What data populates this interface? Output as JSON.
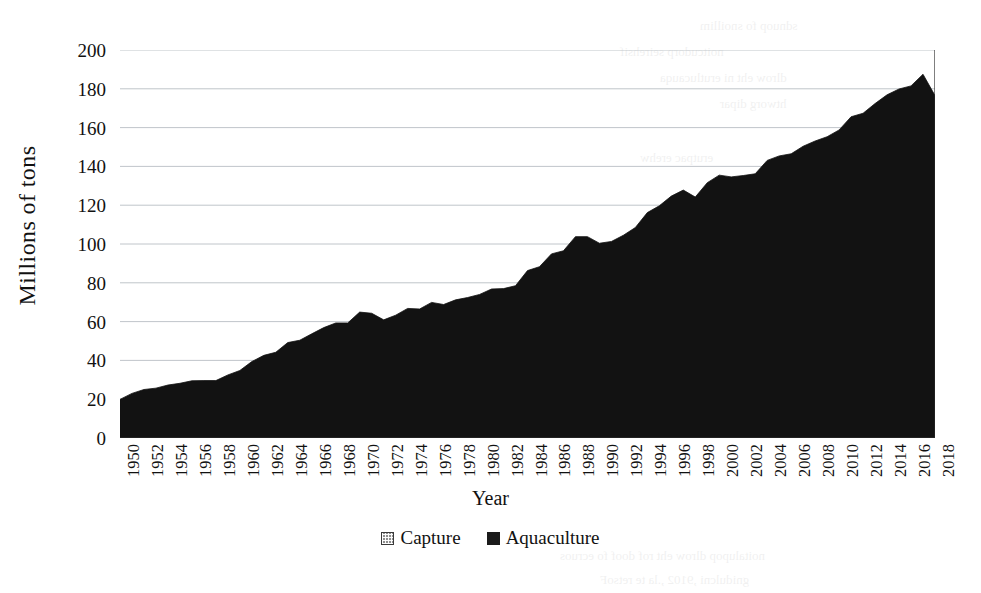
{
  "axes": {
    "y_title": "Millions of tons",
    "x_title": "Year",
    "y_ticks": [
      "0",
      "20",
      "40",
      "60",
      "80",
      "100",
      "120",
      "140",
      "160",
      "180",
      "200"
    ],
    "x_ticks": [
      "1950",
      "1952",
      "1954",
      "1956",
      "1958",
      "1960",
      "1962",
      "1964",
      "1966",
      "1968",
      "1970",
      "1972",
      "1974",
      "1976",
      "1978",
      "1980",
      "1982",
      "1984",
      "1986",
      "1988",
      "1990",
      "1992",
      "1994",
      "1996",
      "1998",
      "2000",
      "2002",
      "2004",
      "2006",
      "2008",
      "2010",
      "2012",
      "2014",
      "2016",
      "2018"
    ]
  },
  "legend": {
    "items": [
      {
        "label": "Capture",
        "swatch": "capture",
        "color": "#8e8e8e"
      },
      {
        "label": "Aquaculture",
        "swatch": "aquaculture",
        "color": "#1b1b1b"
      }
    ]
  },
  "background_bleed": [
    {
      "text": "sdnuop fo snoillim",
      "x": 700,
      "y": 18
    },
    {
      "text": "noitcudorp seirehsif",
      "x": 620,
      "y": 44
    },
    {
      "text": "dlrow eht ni erutlucauqa",
      "x": 660,
      "y": 70
    },
    {
      "text": "htworg dipar",
      "x": 720,
      "y": 96
    },
    {
      "text": "erutpac erehw",
      "x": 640,
      "y": 150
    },
    {
      "text": "debbalp sah",
      "x": 700,
      "y": 200
    },
    {
      "text": "noitcudorp latot",
      "x": 620,
      "y": 250
    },
    {
      "text": "snot fo snoillim",
      "x": 690,
      "y": 300
    },
    {
      "text": "OAF eht ot gnidrocca",
      "x": 600,
      "y": 350
    },
    {
      "text": ".sesaercni",
      "x": 760,
      "y": 400
    },
    {
      "text": "noitalupop dlrow eht rof doof fo ecruos",
      "x": 560,
      "y": 548
    },
    {
      "text": "gnidulcni ,9102 ,.la te retsoF",
      "x": 600,
      "y": 572
    }
  ],
  "chart_data": {
    "type": "area",
    "stacked": true,
    "title": "",
    "xlabel": "Year",
    "ylabel": "Millions of tons",
    "xlim": [
      1950,
      2018
    ],
    "ylim": [
      0,
      200
    ],
    "grid": "horizontal",
    "legend_position": "bottom",
    "x": [
      1950,
      1951,
      1952,
      1953,
      1954,
      1955,
      1956,
      1957,
      1958,
      1959,
      1960,
      1961,
      1962,
      1963,
      1964,
      1965,
      1966,
      1967,
      1968,
      1969,
      1970,
      1971,
      1972,
      1973,
      1974,
      1975,
      1976,
      1977,
      1978,
      1979,
      1980,
      1981,
      1982,
      1983,
      1984,
      1985,
      1986,
      1987,
      1988,
      1989,
      1990,
      1991,
      1992,
      1993,
      1994,
      1995,
      1996,
      1997,
      1998,
      1999,
      2000,
      2001,
      2002,
      2003,
      2004,
      2005,
      2006,
      2007,
      2008,
      2009,
      2010,
      2011,
      2012,
      2013,
      2014,
      2015,
      2016,
      2017,
      2018
    ],
    "series": [
      {
        "name": "Capture",
        "color": "#8e8e8e",
        "values": [
          19.3,
          22.3,
          24.3,
          24.9,
          26.4,
          27.2,
          28.4,
          28.5,
          28.4,
          31.2,
          33.4,
          37.9,
          41.0,
          42.5,
          47.4,
          48.5,
          51.7,
          54.7,
          57.0,
          56.9,
          62.3,
          61.5,
          57.7,
          59.8,
          63.0,
          62.4,
          65.5,
          64.1,
          66.1,
          66.9,
          67.9,
          69.8,
          69.5,
          70.0,
          76.5,
          77.0,
          82.3,
          82.3,
          88.2,
          87.4,
          83.4,
          83.0,
          84.4,
          85.7,
          90.0,
          90.0,
          92.2,
          92.4,
          86.1,
          91.2,
          92.5,
          90.0,
          88.4,
          86.9,
          91.0,
          90.2,
          88.1,
          88.9,
          88.3,
          87.3,
          87.1,
          90.2,
          88.4,
          89.8,
          90.4,
          90.5,
          89.4,
          92.5,
          94.4
        ]
      },
      {
        "name": "Aquaculture",
        "color": "#1b1b1b",
        "values": [
          0.6,
          0.7,
          0.7,
          0.8,
          0.9,
          1.0,
          1.1,
          1.1,
          1.2,
          1.3,
          1.4,
          1.5,
          1.6,
          1.7,
          1.8,
          1.9,
          2.0,
          2.2,
          2.3,
          2.4,
          2.6,
          2.8,
          3.2,
          3.5,
          3.8,
          4.1,
          4.4,
          4.7,
          5.1,
          5.5,
          6.1,
          7.0,
          7.5,
          8.5,
          9.8,
          11.3,
          12.6,
          14.2,
          15.6,
          16.4,
          17.0,
          18.3,
          20.1,
          22.8,
          26.2,
          29.7,
          32.5,
          35.4,
          38.1,
          40.4,
          43.0,
          44.6,
          46.9,
          49.3,
          52.1,
          55.2,
          58.4,
          61.5,
          64.8,
          68.0,
          71.7,
          75.4,
          79.0,
          82.6,
          86.5,
          89.4,
          92.1,
          95.0,
          82.1
        ]
      }
    ]
  }
}
